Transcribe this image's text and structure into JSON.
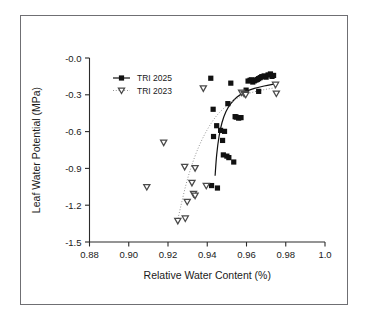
{
  "figure": {
    "background_color": "#ffffff",
    "border_color": "#6f6f73",
    "axis_color": "#2b2b2b"
  },
  "chart_data": {
    "type": "scatter",
    "title": "",
    "subtitle": "",
    "xlabel": "Relative Water Content (%)",
    "ylabel": "Leaf Water Potential (MPa)",
    "xlim": [
      0.88,
      1.0
    ],
    "ylim": [
      -1.5,
      0.0
    ],
    "xticks": [
      0.88,
      0.9,
      0.92,
      0.94,
      0.96,
      0.98,
      1.0
    ],
    "xtick_labels": [
      "0.88",
      "0.90",
      "0.92",
      "0.94",
      "0.96",
      "0.98",
      "1.0"
    ],
    "yticks": [
      0.0,
      -0.3,
      -0.6,
      -0.9,
      -1.2,
      -1.5
    ],
    "ytick_labels": [
      "-0.0",
      "-0.3",
      "-0.6",
      "-0.9",
      "-1.2",
      "-1.5"
    ],
    "grid": false,
    "legend_position": "upper-left",
    "series": [
      {
        "name": "TRI 2025",
        "marker": "filled-square",
        "marker_color": "#111111",
        "line_style": "solid",
        "line_color": "#111111",
        "points": [
          [
            0.9418,
            -0.165
          ],
          [
            0.952,
            -0.205
          ],
          [
            0.9598,
            -0.262
          ],
          [
            0.9608,
            -0.188
          ],
          [
            0.9618,
            -0.182
          ],
          [
            0.9625,
            -0.178
          ],
          [
            0.9632,
            -0.196
          ],
          [
            0.964,
            -0.186
          ],
          [
            0.9648,
            -0.18
          ],
          [
            0.9655,
            -0.175
          ],
          [
            0.9662,
            -0.168
          ],
          [
            0.967,
            -0.16
          ],
          [
            0.9678,
            -0.152
          ],
          [
            0.969,
            -0.146
          ],
          [
            0.97,
            -0.156
          ],
          [
            0.971,
            -0.138
          ],
          [
            0.9722,
            -0.13
          ],
          [
            0.973,
            -0.15
          ],
          [
            0.9738,
            -0.142
          ],
          [
            0.9662,
            -0.272
          ],
          [
            0.943,
            -0.418
          ],
          [
            0.9505,
            -0.372
          ],
          [
            0.9542,
            -0.478
          ],
          [
            0.9548,
            -0.482
          ],
          [
            0.956,
            -0.49
          ],
          [
            0.9572,
            -0.486
          ],
          [
            0.9448,
            -0.552
          ],
          [
            0.9468,
            -0.59
          ],
          [
            0.9488,
            -0.598
          ],
          [
            0.9432,
            -0.64
          ],
          [
            0.9478,
            -0.672
          ],
          [
            0.9482,
            -0.79
          ],
          [
            0.95,
            -0.8
          ],
          [
            0.951,
            -0.812
          ],
          [
            0.9535,
            -0.848
          ],
          [
            0.9422,
            -1.04
          ],
          [
            0.9452,
            -1.06
          ]
        ],
        "fit_curve": [
          [
            0.944,
            -0.96
          ],
          [
            0.9448,
            -0.79
          ],
          [
            0.946,
            -0.64
          ],
          [
            0.9475,
            -0.528
          ],
          [
            0.9495,
            -0.438
          ],
          [
            0.952,
            -0.372
          ],
          [
            0.9552,
            -0.318
          ],
          [
            0.9592,
            -0.278
          ],
          [
            0.964,
            -0.248
          ],
          [
            0.969,
            -0.228
          ],
          [
            0.974,
            -0.212
          ]
        ]
      },
      {
        "name": "TRI 2023",
        "marker": "down-triangle",
        "marker_color": "#4a4a4a",
        "line_style": "dotted",
        "line_color": "#8a8a8a",
        "points": [
          [
            0.938,
            -0.248
          ],
          [
            0.9575,
            -0.282
          ],
          [
            0.9588,
            -0.292
          ],
          [
            0.9596,
            -0.3
          ],
          [
            0.9748,
            -0.218
          ],
          [
            0.9752,
            -0.29
          ],
          [
            0.9178,
            -0.69
          ],
          [
            0.9285,
            -0.888
          ],
          [
            0.9338,
            -0.898
          ],
          [
            0.9092,
            -1.052
          ],
          [
            0.9322,
            -1.018
          ],
          [
            0.9395,
            -1.042
          ],
          [
            0.933,
            -1.108
          ],
          [
            0.9338,
            -1.122
          ],
          [
            0.9298,
            -1.172
          ],
          [
            0.925,
            -1.328
          ],
          [
            0.9288,
            -1.308
          ]
        ],
        "fit_curve": [
          [
            0.9248,
            -1.33
          ],
          [
            0.9268,
            -1.19
          ],
          [
            0.9292,
            -1.03
          ],
          [
            0.932,
            -0.88
          ],
          [
            0.9355,
            -0.73
          ],
          [
            0.9398,
            -0.59
          ],
          [
            0.9448,
            -0.47
          ],
          [
            0.9505,
            -0.382
          ],
          [
            0.9565,
            -0.318
          ],
          [
            0.9625,
            -0.282
          ],
          [
            0.969,
            -0.258
          ],
          [
            0.975,
            -0.242
          ]
        ]
      }
    ]
  },
  "legend": {
    "entries": [
      {
        "label": "TRI 2025"
      },
      {
        "label": "TRI 2023"
      }
    ]
  }
}
